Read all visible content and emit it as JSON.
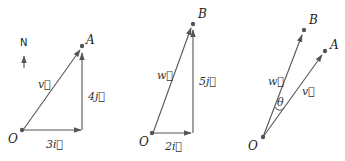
{
  "compass": {
    "label": "N",
    "icon": "north-arrow-icon"
  },
  "panels": [
    {
      "name": "vector-v-decomposition",
      "origin_label": "O",
      "point_label": "A",
      "vector_label": "v⃗",
      "horizontal_label": "3i⃗",
      "vertical_label": "4j⃗"
    },
    {
      "name": "vector-w-decomposition",
      "origin_label": "O",
      "point_label": "B",
      "vector_label": "w⃗",
      "horizontal_label": "2i⃗",
      "vertical_label": "5j⃗"
    },
    {
      "name": "angle-between-vectors",
      "origin_label": "O",
      "point_a_label": "A",
      "point_b_label": "B",
      "vector_v_label": "v⃗",
      "vector_w_label": "w⃗",
      "angle_label": "θ"
    }
  ],
  "colors": {
    "stroke": "#555555",
    "text": "#222222",
    "background": "#ffffff"
  }
}
